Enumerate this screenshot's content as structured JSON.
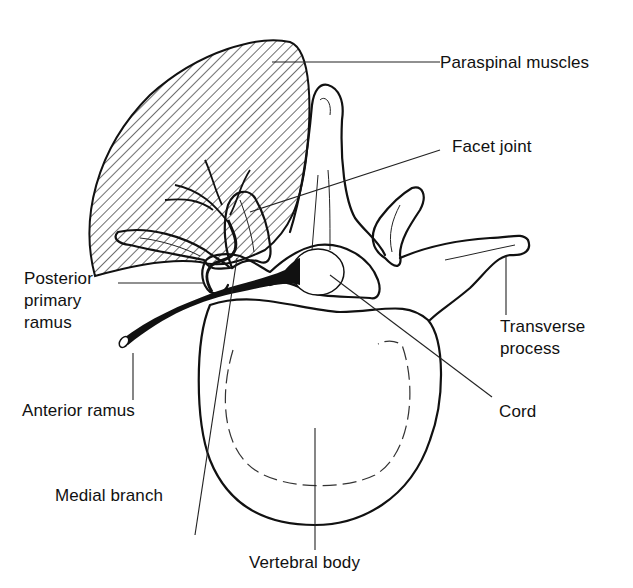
{
  "diagram": {
    "labels": {
      "paraspinal_muscles": "Paraspinal muscles",
      "facet_joint": "Facet joint",
      "posterior_primary_ramus": "Posterior\nprimary\nramus",
      "transverse_process": "Transverse\nprocess",
      "anterior_ramus": "Anterior ramus",
      "cord": "Cord",
      "medial_branch": "Medial branch",
      "vertebral_body": "Vertebral body"
    },
    "colors": {
      "ink": "#111111",
      "background": "#ffffff"
    }
  }
}
